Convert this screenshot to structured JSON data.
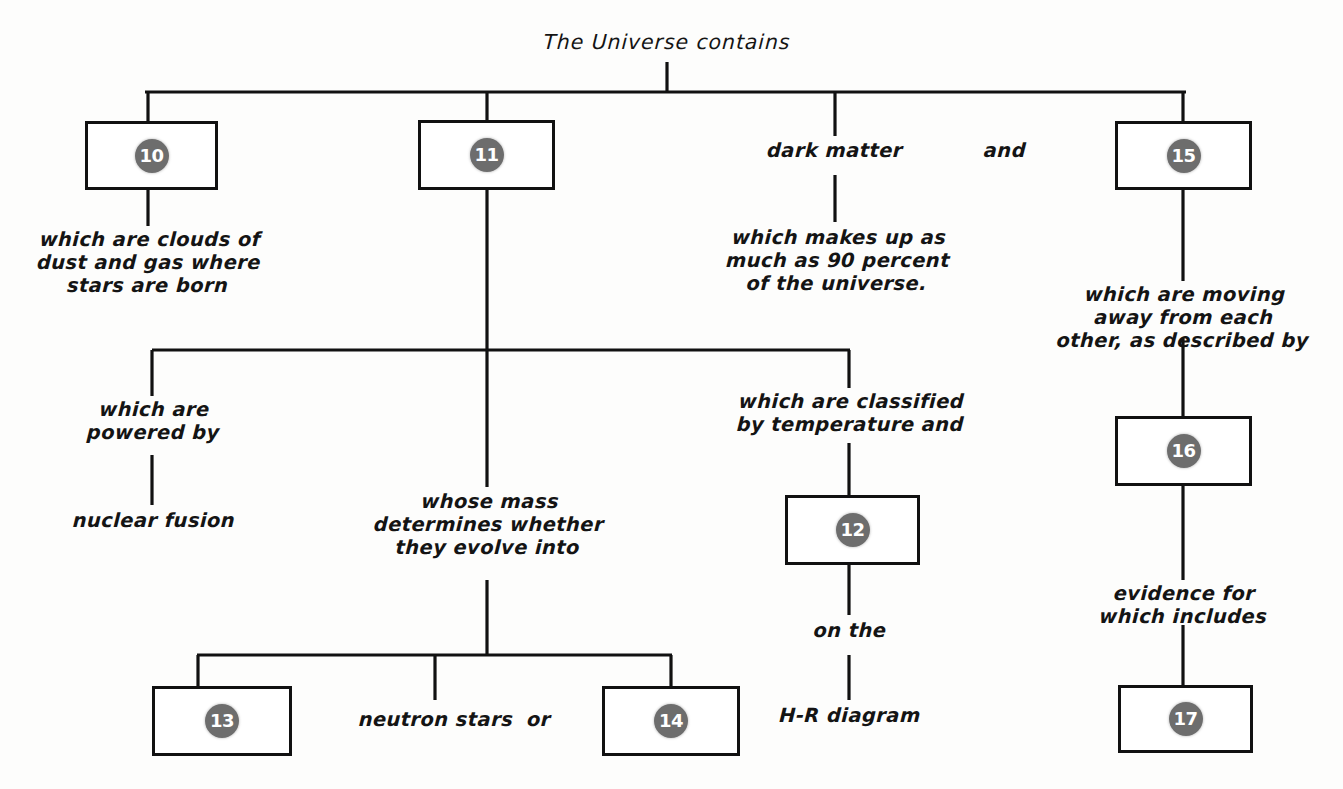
{
  "diagram": {
    "title": "The Universe contains",
    "boxes": [
      {
        "id": "box-10",
        "number": "10"
      },
      {
        "id": "box-11",
        "number": "11"
      },
      {
        "id": "box-15",
        "number": "15"
      },
      {
        "id": "box-12",
        "number": "12"
      },
      {
        "id": "box-16",
        "number": "16"
      },
      {
        "id": "box-13",
        "number": "13"
      },
      {
        "id": "box-14",
        "number": "14"
      },
      {
        "id": "box-17",
        "number": "17"
      }
    ],
    "labels": {
      "nebulae_desc": "which are clouds of\ndust and gas where\nstars are born",
      "dark_matter": "dark matter",
      "and": "and",
      "dark_matter_desc": "which makes up as\nmuch as 90 percent\nof the universe.",
      "galaxies_desc": "which are moving\naway from each\nother, as described by",
      "powered_by": "which are\npowered by",
      "nuclear_fusion": "nuclear fusion",
      "whose_mass": "whose mass\ndetermines whether\nthey evolve into",
      "classified_by": "which are classified\nby temperature and",
      "on_the": "on the",
      "hr_diagram": "H-R diagram",
      "neutron_stars": "neutron stars",
      "or": "or",
      "evidence_for": "evidence for\nwhich includes"
    },
    "colors": {
      "line": "#111111",
      "circle": "#6d6d6d",
      "circle_text": "#ffffff",
      "background": "#fdfdfc"
    }
  }
}
